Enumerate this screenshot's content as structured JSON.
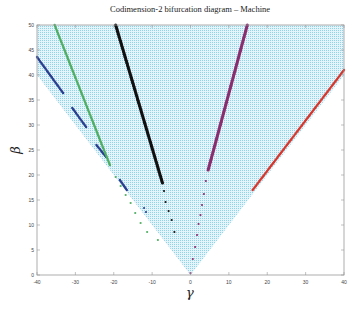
{
  "chart_data": {
    "type": "scatter",
    "title": "Codimension-2 bifurcation diagram – Machine",
    "xlabel": "γ",
    "ylabel": "β",
    "xlim": [
      -40,
      40
    ],
    "ylim": [
      0,
      50
    ],
    "xticks": [
      -40,
      -30,
      -20,
      -10,
      0,
      10,
      20,
      30,
      40
    ],
    "yticks": [
      0,
      5,
      10,
      15,
      20,
      25,
      30,
      35,
      40,
      45,
      50
    ],
    "grid": false,
    "legend": null,
    "background_region": {
      "description": "dense light-blue dotted region bounded by beta >= |gamma| (triangle with apex at origin)",
      "color": "#8fd3e8",
      "vertices": [
        [
          0,
          0
        ],
        [
          -40,
          40
        ],
        [
          -40,
          50
        ],
        [
          40,
          50
        ],
        [
          40,
          40
        ]
      ]
    },
    "series": [
      {
        "name": "blue",
        "color": "#2a3f8f",
        "segments": [
          [
            [
              -40,
              43.6
            ],
            [
              -33.2,
              36.4
            ]
          ],
          [
            [
              -30.8,
              33.4
            ],
            [
              -27.2,
              29.6
            ]
          ],
          [
            [
              -24.5,
              26.0
            ],
            [
              -22.0,
              23.6
            ]
          ],
          [
            [
              -18.4,
              19.0
            ],
            [
              -16.6,
              17.0
            ]
          ]
        ],
        "points": [
          [
            -12.1,
            13.4
          ],
          [
            -11.6,
            12.6
          ]
        ]
      },
      {
        "name": "green",
        "color": "#4fae62",
        "segments": [
          [
            [
              -35.4,
              50
            ],
            [
              -21.0,
              22.0
            ]
          ]
        ],
        "points": [
          [
            -19.5,
            19.6
          ],
          [
            -18.2,
            17.8
          ],
          [
            -16.9,
            16.0
          ],
          [
            -15.6,
            14.4
          ],
          [
            -14.4,
            12.4
          ],
          [
            -13.0,
            10.4
          ],
          [
            -11.3,
            8.6
          ],
          [
            -8.5,
            7.0
          ]
        ]
      },
      {
        "name": "black",
        "color": "#111111",
        "segments": [
          [
            [
              -19.5,
              50
            ],
            [
              -7.3,
              18.4
            ]
          ]
        ],
        "points": [
          [
            -6.9,
            16.8
          ],
          [
            -6.5,
            14.6
          ],
          [
            -5.7,
            12.8
          ],
          [
            -4.9,
            11.0
          ],
          [
            -4.2,
            8.6
          ]
        ]
      },
      {
        "name": "purple",
        "color": "#8a2d6e",
        "segments": [
          [
            [
              14.8,
              50
            ],
            [
              4.6,
              21.0
            ]
          ]
        ],
        "points": [
          [
            4.0,
            18.8
          ],
          [
            3.5,
            16.2
          ],
          [
            3.0,
            14.0
          ],
          [
            2.6,
            12.0
          ],
          [
            2.1,
            10.2
          ],
          [
            1.7,
            8.0
          ],
          [
            1.2,
            5.6
          ],
          [
            0.6,
            3.2
          ],
          [
            0.0,
            0.4
          ]
        ]
      },
      {
        "name": "red",
        "color": "#d8362b",
        "segments": [
          [
            [
              16.2,
              17.0
            ],
            [
              40,
              41.0
            ]
          ]
        ],
        "points": []
      }
    ]
  }
}
